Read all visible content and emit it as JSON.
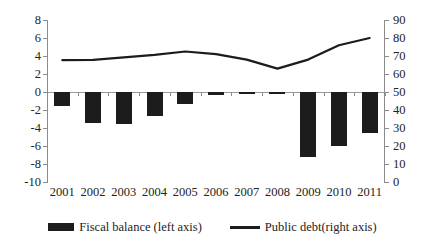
{
  "chart_data": {
    "type": "bar",
    "title": "",
    "subtitle": "",
    "xlabel": "",
    "ylabel": "",
    "grid": false,
    "legend_position": "bottom",
    "categories": [
      "2001",
      "2002",
      "2003",
      "2004",
      "2005",
      "2006",
      "2007",
      "2008",
      "2009",
      "2010",
      "2011"
    ],
    "axes": {
      "left": {
        "label": "",
        "ylim": [
          -10,
          8
        ],
        "ticks": [
          8,
          6,
          4,
          2,
          0,
          -2,
          -4,
          -6,
          -8,
          -10
        ],
        "tick_labels": [
          "8",
          "6",
          "4",
          "2",
          "0",
          "-2",
          "-4",
          "-6",
          "-8",
          "-10"
        ]
      },
      "right": {
        "label": "",
        "ylim": [
          0,
          90
        ],
        "ticks": [
          90,
          80,
          70,
          60,
          50,
          40,
          30,
          20,
          10,
          0
        ],
        "tick_labels": [
          "90",
          "80",
          "70",
          "60",
          "50",
          "40",
          "30",
          "20",
          "10",
          "0"
        ]
      }
    },
    "series": [
      {
        "name": "Fiscal balance (left axis)",
        "type": "bar",
        "axis": "left",
        "color": "#1c1c1c",
        "values": [
          -1.5,
          -3.4,
          -3.6,
          -2.7,
          -1.3,
          -0.35,
          -0.2,
          -0.1,
          -7.2,
          -6.0,
          -4.5
        ]
      },
      {
        "name": "Public debt(right axis)",
        "type": "line",
        "axis": "right",
        "color": "#1c1c1c",
        "values": [
          67.7,
          67.8,
          69.2,
          70.6,
          72.5,
          71.0,
          68.0,
          63.0,
          68.0,
          76.0,
          80.0
        ]
      }
    ]
  },
  "legend": {
    "items": [
      {
        "label": "Fiscal balance (left axis)",
        "marker": "bar-swatch"
      },
      {
        "label": "Public debt(right axis)",
        "marker": "line-swatch"
      }
    ]
  }
}
